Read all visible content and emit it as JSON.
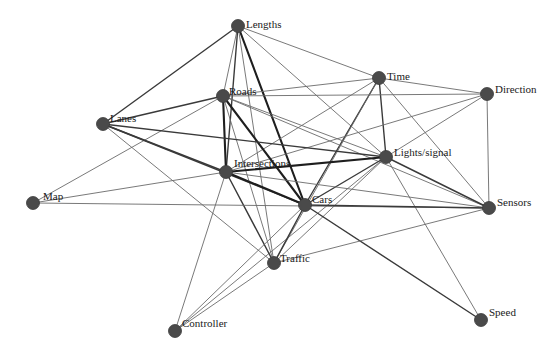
{
  "diagram": {
    "type": "network-graph",
    "node_color": "#4a4a4a",
    "edge_color": "#555555",
    "background": "#ffffff",
    "nodes": [
      {
        "id": "lengths",
        "label": "Lengths",
        "x": 238,
        "y": 26,
        "lx": 8,
        "ly": 2
      },
      {
        "id": "time",
        "label": "Time",
        "x": 379,
        "y": 78,
        "lx": 8,
        "ly": 2
      },
      {
        "id": "direction",
        "label": "Direction",
        "x": 487,
        "y": 94,
        "lx": 8,
        "ly": -1
      },
      {
        "id": "roads",
        "label": "Roads",
        "x": 223,
        "y": 96,
        "lx": 6,
        "ly": -1
      },
      {
        "id": "lanes",
        "label": "Lanes",
        "x": 103,
        "y": 124,
        "lx": 7,
        "ly": -2
      },
      {
        "id": "lights",
        "label": "Lights/signal",
        "x": 386,
        "y": 157,
        "lx": 8,
        "ly": -1
      },
      {
        "id": "intersections",
        "label": "Intersections",
        "x": 226,
        "y": 172,
        "lx": 8,
        "ly": -5
      },
      {
        "id": "map",
        "label": "Map",
        "x": 33,
        "y": 203,
        "lx": 10,
        "ly": -3
      },
      {
        "id": "cars",
        "label": "Cars",
        "x": 305,
        "y": 205,
        "lx": 7,
        "ly": -2
      },
      {
        "id": "sensors",
        "label": "Sensors",
        "x": 489,
        "y": 208,
        "lx": 8,
        "ly": -2
      },
      {
        "id": "traffic",
        "label": "Traffic",
        "x": 274,
        "y": 263,
        "lx": 6,
        "ly": -1
      },
      {
        "id": "controller",
        "label": "Controller",
        "x": 175,
        "y": 331,
        "lx": 7,
        "ly": -4
      },
      {
        "id": "speed",
        "label": "Speed",
        "x": 481,
        "y": 320,
        "lx": 8,
        "ly": -4
      }
    ],
    "edges": [
      {
        "from": "lengths",
        "to": "lanes",
        "weight": 2
      },
      {
        "from": "lengths",
        "to": "roads",
        "weight": 1
      },
      {
        "from": "lengths",
        "to": "intersections",
        "weight": 2
      },
      {
        "from": "lengths",
        "to": "cars",
        "weight": 3
      },
      {
        "from": "lengths",
        "to": "time",
        "weight": 1
      },
      {
        "from": "lengths",
        "to": "lights",
        "weight": 1
      },
      {
        "from": "lengths",
        "to": "traffic",
        "weight": 1
      },
      {
        "from": "time",
        "to": "roads",
        "weight": 1
      },
      {
        "from": "time",
        "to": "direction",
        "weight": 1
      },
      {
        "from": "time",
        "to": "lights",
        "weight": 2
      },
      {
        "from": "time",
        "to": "cars",
        "weight": 2
      },
      {
        "from": "time",
        "to": "intersections",
        "weight": 1
      },
      {
        "from": "time",
        "to": "sensors",
        "weight": 1
      },
      {
        "from": "time",
        "to": "traffic",
        "weight": 1
      },
      {
        "from": "direction",
        "to": "roads",
        "weight": 1
      },
      {
        "from": "direction",
        "to": "lights",
        "weight": 1
      },
      {
        "from": "direction",
        "to": "intersections",
        "weight": 1
      },
      {
        "from": "direction",
        "to": "sensors",
        "weight": 1
      },
      {
        "from": "roads",
        "to": "lanes",
        "weight": 2
      },
      {
        "from": "roads",
        "to": "intersections",
        "weight": 3
      },
      {
        "from": "roads",
        "to": "cars",
        "weight": 3
      },
      {
        "from": "roads",
        "to": "traffic",
        "weight": 1
      },
      {
        "from": "roads",
        "to": "lights",
        "weight": 1
      },
      {
        "from": "roads",
        "to": "map",
        "weight": 1
      },
      {
        "from": "roads",
        "to": "sensors",
        "weight": 1
      },
      {
        "from": "lanes",
        "to": "intersections",
        "weight": 2
      },
      {
        "from": "lanes",
        "to": "cars",
        "weight": 2
      },
      {
        "from": "lanes",
        "to": "lights",
        "weight": 2
      },
      {
        "from": "lanes",
        "to": "traffic",
        "weight": 1
      },
      {
        "from": "lights",
        "to": "intersections",
        "weight": 3
      },
      {
        "from": "lights",
        "to": "cars",
        "weight": 2
      },
      {
        "from": "lights",
        "to": "sensors",
        "weight": 2
      },
      {
        "from": "lights",
        "to": "speed",
        "weight": 1
      },
      {
        "from": "lights",
        "to": "traffic",
        "weight": 1
      },
      {
        "from": "lights",
        "to": "controller",
        "weight": 1
      },
      {
        "from": "intersections",
        "to": "cars",
        "weight": 3
      },
      {
        "from": "intersections",
        "to": "traffic",
        "weight": 2
      },
      {
        "from": "intersections",
        "to": "map",
        "weight": 1
      },
      {
        "from": "intersections",
        "to": "controller",
        "weight": 1
      },
      {
        "from": "intersections",
        "to": "sensors",
        "weight": 1
      },
      {
        "from": "map",
        "to": "sensors",
        "weight": 1
      },
      {
        "from": "cars",
        "to": "sensors",
        "weight": 2
      },
      {
        "from": "cars",
        "to": "traffic",
        "weight": 2
      },
      {
        "from": "cars",
        "to": "speed",
        "weight": 2
      },
      {
        "from": "cars",
        "to": "controller",
        "weight": 1
      },
      {
        "from": "traffic",
        "to": "sensors",
        "weight": 1
      },
      {
        "from": "traffic",
        "to": "controller",
        "weight": 1
      }
    ]
  }
}
